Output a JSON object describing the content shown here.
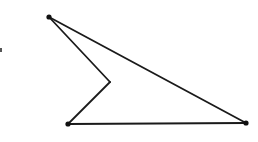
{
  "diagram": {
    "type": "concave-quadrilateral",
    "colors": {
      "background": "#ffffff",
      "stroke": "#1a1a1a",
      "vertex": "#111111"
    },
    "vertices": [
      {
        "id": "top-left",
        "x": 49,
        "y": 17,
        "dot": true
      },
      {
        "id": "reflex",
        "x": 110,
        "y": 82,
        "dot": false
      },
      {
        "id": "bottom-left",
        "x": 68,
        "y": 124,
        "dot": true
      },
      {
        "id": "bottom-right",
        "x": 246,
        "y": 123,
        "dot": true
      }
    ],
    "edges": [
      {
        "from": "top-left",
        "to": "reflex"
      },
      {
        "from": "reflex",
        "to": "bottom-left"
      },
      {
        "from": "bottom-left",
        "to": "bottom-right"
      },
      {
        "from": "bottom-right",
        "to": "top-left"
      }
    ],
    "stray_mark": {
      "x": 1,
      "y": 50
    }
  }
}
